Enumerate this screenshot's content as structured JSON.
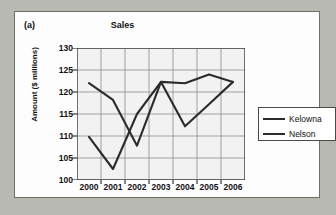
{
  "figure": {
    "panel_label": "(a)",
    "title": "Sales"
  },
  "legend": {
    "position": "right",
    "items": [
      {
        "label": "Kelowna",
        "color": "#2b2b2b"
      },
      {
        "label": "Nelson",
        "color": "#2b2b2b"
      }
    ]
  },
  "chart_data": {
    "type": "line",
    "title": "Sales",
    "xlabel": "",
    "ylabel": "Amount ($ millions)",
    "categories": [
      "2000",
      "2001",
      "2002",
      "2003",
      "2004",
      "2005",
      "2006"
    ],
    "xticklabels": [
      "2000",
      "2001",
      "2002",
      "2003",
      "2004",
      "2005",
      "2006"
    ],
    "yticklabels": [
      "100",
      "105",
      "110",
      "115",
      "120",
      "125",
      "130"
    ],
    "ylim": [
      100,
      130
    ],
    "ytick_step": 5,
    "grid": true,
    "legend_position": "right",
    "series": [
      {
        "name": "Kelowna",
        "color": "#2b2b2b",
        "values": [
          109.8,
          102.5,
          115.0,
          122.3,
          122.0,
          124.0,
          122.3
        ]
      },
      {
        "name": "Nelson",
        "color": "#2b2b2b",
        "values": [
          122.0,
          118.2,
          107.8,
          122.3,
          112.2,
          117.2,
          122.3
        ]
      }
    ]
  }
}
